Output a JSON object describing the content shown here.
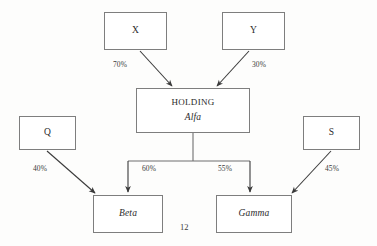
{
  "diagram": {
    "type": "organizational-ownership-chart",
    "page_number": "12",
    "stroke_color": "#7e7e7e",
    "arrow_color": "#3a3a3a",
    "text_color": "#2b2b2b",
    "nodes": [
      {
        "id": "x",
        "label": "X",
        "italic": false,
        "x": 104,
        "y": 12,
        "w": 63,
        "h": 38
      },
      {
        "id": "y",
        "label": "Y",
        "italic": false,
        "x": 222,
        "y": 12,
        "w": 63,
        "h": 38
      },
      {
        "id": "holding",
        "label": "HOLDING",
        "sublabel": "Alfa",
        "italic": false,
        "sublabel_italic": true,
        "x": 136,
        "y": 88,
        "w": 114,
        "h": 45
      },
      {
        "id": "q",
        "label": "Q",
        "italic": false,
        "x": 19,
        "y": 116,
        "w": 57,
        "h": 34
      },
      {
        "id": "s",
        "label": "S",
        "italic": false,
        "x": 303,
        "y": 116,
        "w": 57,
        "h": 34
      },
      {
        "id": "beta",
        "label": "Beta",
        "italic": true,
        "x": 93,
        "y": 195,
        "w": 70,
        "h": 38
      },
      {
        "id": "gamma",
        "label": "Gamma",
        "italic": true,
        "x": 216,
        "y": 195,
        "w": 76,
        "h": 38
      }
    ],
    "edges": [
      {
        "id": "x-holding",
        "from": "x",
        "to": "holding",
        "percent": "70%",
        "label_x": 113,
        "label_y": 60
      },
      {
        "id": "y-holding",
        "from": "y",
        "to": "holding",
        "percent": "30%",
        "label_x": 252,
        "label_y": 60
      },
      {
        "id": "q-beta",
        "from": "q",
        "to": "beta",
        "percent": "40%",
        "label_x": 33,
        "label_y": 164
      },
      {
        "id": "holding-beta",
        "from": "holding",
        "to": "beta",
        "percent": "60%",
        "label_x": 142,
        "label_y": 164
      },
      {
        "id": "holding-gamma",
        "from": "holding",
        "to": "gamma",
        "percent": "55%",
        "label_x": 218,
        "label_y": 164
      },
      {
        "id": "s-gamma",
        "from": "s",
        "to": "gamma",
        "percent": "45%",
        "label_x": 325,
        "label_y": 164
      }
    ]
  }
}
